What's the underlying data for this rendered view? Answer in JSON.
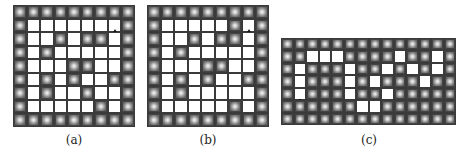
{
  "figure": {
    "panels": [
      {
        "id": "a",
        "label": "(a)",
        "rows": 9,
        "cols": 9,
        "layout": [
          "WWWWWWWWW",
          "W......GW",
          "W..W.WW.W",
          "W.W.....W",
          "W...WW..W",
          "W.W.W..WW",
          "W.W..W..W",
          "W.....W.W",
          "WWWWWWWWW"
        ],
        "goal_icon": "money-bag-icon",
        "goal_text": "$"
      },
      {
        "id": "b",
        "label": "(b)",
        "rows": 9,
        "cols": 9,
        "layout": [
          "WWWWWWWWW",
          "W.....WGW",
          "W..W.WW.W",
          "W.W.....W",
          "W...WW..W",
          "W.W.W..WW",
          "W.W.....W",
          "W.....W.W",
          "WWWWWWWWW"
        ],
        "goal_icon": "money-bag-icon",
        "goal_text": "$"
      },
      {
        "id": "c",
        "label": "(c)",
        "rows": 7,
        "cols": 14,
        "layout": [
          "WWWWWWWWWWWWWW",
          "WW...WWWW.WW.W",
          "W.WWW.WW.W.W.W",
          "W.WWW.W.WWW.WW",
          "WGWWW.WW.WWWWW",
          "WWWWWW..WWWWWW",
          "WWWWWWWWWWWWWW"
        ],
        "goal_icon": "money-bag-icon",
        "goal_text": "$"
      }
    ],
    "legend": {
      "W": "wall",
      ".": "empty",
      "G": "goal"
    }
  }
}
